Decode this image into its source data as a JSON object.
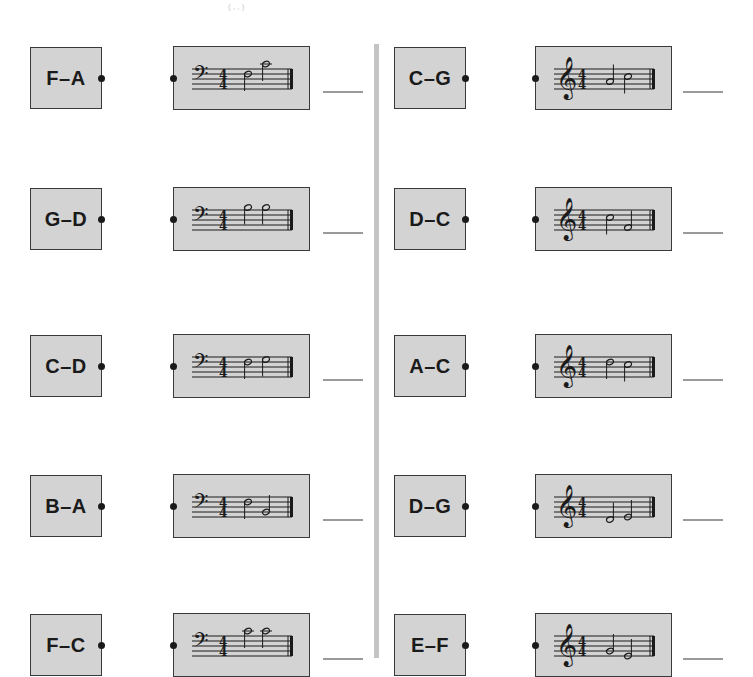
{
  "header": {
    "fragment": "( , , )"
  },
  "colors": {
    "box_fill": "#d3d3d3",
    "border": "#3a3a3a",
    "divider": "#c4c4c4",
    "ink": "#1a1a1a",
    "blank_line": "#9a9a9a"
  },
  "left_column": {
    "clef": "bass",
    "time_signature": "4/4",
    "items": [
      {
        "label": "F–A",
        "notes": [
          {
            "pos": 6,
            "stem": "down"
          },
          {
            "pos": 10,
            "stem": "down"
          }
        ],
        "answer": ""
      },
      {
        "label": "G–D",
        "notes": [
          {
            "pos": 9,
            "stem": "down"
          },
          {
            "pos": 9,
            "stem": "down"
          }
        ],
        "answer": ""
      },
      {
        "label": "C–D",
        "notes": [
          {
            "pos": 6,
            "stem": "down"
          },
          {
            "pos": 7,
            "stem": "down"
          }
        ],
        "answer": ""
      },
      {
        "label": "B–A",
        "notes": [
          {
            "pos": 6,
            "stem": "down"
          },
          {
            "pos": 2,
            "stem": "up"
          }
        ],
        "answer": ""
      },
      {
        "label": "F–C",
        "notes": [
          {
            "pos": 10,
            "stem": "down"
          },
          {
            "pos": 10,
            "stem": "down"
          }
        ],
        "answer": ""
      }
    ]
  },
  "right_column": {
    "clef": "treble",
    "time_signature": "4/4",
    "items": [
      {
        "label": "C–G",
        "notes": [
          {
            "pos": 3,
            "stem": "up"
          },
          {
            "pos": 5,
            "stem": "down"
          }
        ],
        "answer": ""
      },
      {
        "label": "D–C",
        "notes": [
          {
            "pos": 5,
            "stem": "down"
          },
          {
            "pos": 1,
            "stem": "up"
          }
        ],
        "answer": ""
      },
      {
        "label": "A–C",
        "notes": [
          {
            "pos": 6,
            "stem": "down"
          },
          {
            "pos": 5,
            "stem": "down"
          }
        ],
        "answer": ""
      },
      {
        "label": "D–G",
        "notes": [
          {
            "pos": -1,
            "stem": "up"
          },
          {
            "pos": 0,
            "stem": "up"
          }
        ],
        "answer": ""
      },
      {
        "label": "E–F",
        "notes": [
          {
            "pos": 2,
            "stem": "up"
          },
          {
            "pos": 0,
            "stem": "up"
          }
        ],
        "answer": ""
      }
    ]
  }
}
